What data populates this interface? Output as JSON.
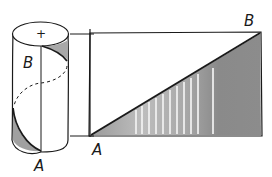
{
  "figure": {
    "colors": {
      "ink": "#1a1a1a",
      "shade": "#8c8c8c",
      "shade_light": "#c8c8c8",
      "background": "#ffffff"
    },
    "cylinder": {
      "center_mark": "+",
      "label_top": "B",
      "label_bottom": "A"
    },
    "unrolled": {
      "label_bottom_left": "A",
      "label_top_right": "B"
    }
  }
}
